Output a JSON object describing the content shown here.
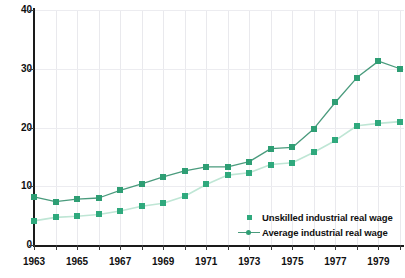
{
  "chart_data": {
    "type": "line",
    "title": "",
    "xlabel": "",
    "ylabel": "",
    "x": [
      1963,
      1964,
      1965,
      1966,
      1967,
      1968,
      1969,
      1970,
      1971,
      1972,
      1973,
      1974,
      1975,
      1976,
      1977,
      1978,
      1979,
      1980
    ],
    "xlim": [
      1963,
      1980
    ],
    "ylim": [
      0,
      40
    ],
    "yticks": [
      0,
      10,
      20,
      30,
      40
    ],
    "xticks": [
      1963,
      1964,
      1965,
      1966,
      1967,
      1968,
      1969,
      1970,
      1971,
      1972,
      1973,
      1974,
      1975,
      1976,
      1977,
      1978,
      1979,
      1980
    ],
    "xtick_labels_shown": [
      "1963",
      "",
      "1965",
      "",
      "1967",
      "",
      "1969",
      "",
      "1971",
      "",
      "1973",
      "",
      "1975",
      "",
      "1977",
      "",
      "1979",
      ""
    ],
    "grid": "vertical and horizontal light gridlines",
    "legend_position": "inside bottom-right",
    "series": [
      {
        "name": "Unskilled industrial real wage",
        "marker": "square",
        "color": "#2fa97d",
        "line_color": "#bfe6d5",
        "values": [
          4.1,
          4.7,
          4.9,
          5.2,
          5.8,
          6.6,
          7.1,
          8.3,
          10.3,
          11.9,
          12.3,
          13.7,
          14.0,
          15.8,
          17.8,
          20.3,
          20.7,
          21.0
        ]
      },
      {
        "name": "Average industrial real wage",
        "marker": "square",
        "color": "#2e9e74",
        "line_color": "#4a9b7d",
        "values": [
          8.2,
          7.4,
          7.8,
          8.0,
          9.3,
          10.4,
          11.6,
          12.6,
          13.3,
          13.3,
          14.2,
          16.4,
          16.6,
          19.8,
          24.3,
          28.5,
          31.3,
          30.0
        ]
      }
    ]
  },
  "axes": {
    "y_tick_labels": [
      "40",
      "30",
      "20",
      "10",
      "0"
    ],
    "x_tick_labels": [
      "1963",
      "1965",
      "1967",
      "1969",
      "1971",
      "1973",
      "1975",
      "1977",
      "1979"
    ]
  },
  "legend": {
    "items": [
      {
        "label": "Unskilled industrial real wage",
        "marker": "square",
        "color": "#2fa97d"
      },
      {
        "label": "Average industrial real wage",
        "marker": "line-dot",
        "color": "#2e9e74"
      }
    ]
  },
  "top_caption": {
    "text": ""
  },
  "colors": {
    "unskilled_marker": "#2fa97d",
    "unskilled_line": "#bfe6d5",
    "average_marker": "#2e9e74",
    "average_line": "#4a9b7d",
    "axis": "#1a1a1a",
    "grid": "#e9e9ed",
    "background": "#ffffff"
  }
}
